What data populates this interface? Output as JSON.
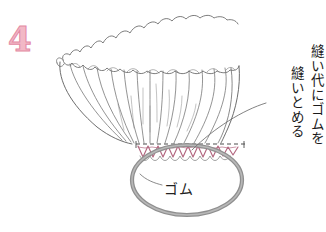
{
  "diagram": {
    "type": "sewing-instruction-illustration",
    "step_number": "4",
    "step_number_color": "#eda9bd",
    "annotations": [
      {
        "id": "annot-col-1",
        "text": "縫い代にゴムを",
        "orientation": "vertical",
        "has_leader_line": true
      },
      {
        "id": "annot-col-2",
        "text": "縫いとめる",
        "orientation": "vertical",
        "has_leader_line": false
      }
    ],
    "labels": [
      {
        "id": "elastic-label",
        "text": "ゴム",
        "has_leader_line": true
      }
    ],
    "parts": {
      "ruffle": {
        "name": "gathered-ruffle-edge",
        "stroke": "#6b6b6b"
      },
      "fabric": {
        "name": "gathered-fabric-body",
        "stroke": "#5a5a5a"
      },
      "seam_allowance": {
        "name": "seam-allowance-dashed-line",
        "stroke": "#555555",
        "style": "dashed"
      },
      "zigzag_stitch": {
        "name": "zigzag-stitch-line",
        "stroke": "#b2667f"
      },
      "elastic_band": {
        "name": "elastic-band-oval",
        "stroke": "#8c8c8c"
      }
    },
    "colors": {
      "background": "#ffffff",
      "ink": "#555555",
      "accent_pink": "#b2667f",
      "step_pink": "#eda9bd",
      "elastic_gray": "#8c8c8c"
    }
  }
}
